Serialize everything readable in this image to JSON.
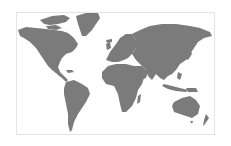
{
  "map": {
    "type": "world-map",
    "projection": "mercator-like",
    "land_color": "#7b7b7b",
    "water_color": "#ffffff",
    "border_color": "#e4e4e4",
    "regions": [
      {
        "name": "North America"
      },
      {
        "name": "Greenland"
      },
      {
        "name": "South America"
      },
      {
        "name": "Europe"
      },
      {
        "name": "Africa"
      },
      {
        "name": "Asia"
      },
      {
        "name": "Australia"
      },
      {
        "name": "New Zealand"
      }
    ]
  }
}
